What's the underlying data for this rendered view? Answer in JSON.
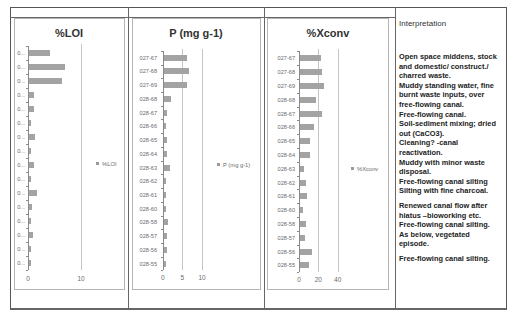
{
  "table": {
    "interpretation_header": "Interpretation",
    "interpretation_entries": [
      {
        "text": "Open space middens, stock\nand domestic/ construct./\ncharred waste.",
        "gap_before": false
      },
      {
        "text": "Muddy standing water, fine\nburnt waste inputs, over\nfree-flowing canal.",
        "gap_before": false
      },
      {
        "text": "Free-flowing canal.",
        "gap_before": false
      },
      {
        "text": "Soil-sediment mixing; dried\nout (CaCO3).",
        "gap_before": false
      },
      {
        "text": "Cleaning? -canal\nreactivation.",
        "gap_before": false
      },
      {
        "text": "Muddy with minor waste\ndisposal.",
        "gap_before": false
      },
      {
        "text": "Free-flowing canal silting",
        "gap_before": false
      },
      {
        "text": "Silting with fine charcoal.",
        "gap_before": false
      },
      {
        "text": "Renewed canal flow after\nhiatus –bioworking etc.",
        "gap_before": true
      },
      {
        "text": "Free-flowing canal silting.",
        "gap_before": false
      },
      {
        "text": "As below, vegetated\nepisode.",
        "gap_before": false
      },
      {
        "text": "Free-flowing canal silting.",
        "gap_before": true
      }
    ]
  },
  "colors": {
    "bar": "#a3a3a3",
    "border": "#555555",
    "chart_border": "#b5b5b5",
    "text": "#6a6a6a"
  },
  "chart_data": [
    {
      "id": "loi",
      "type": "bar",
      "orientation": "horizontal",
      "title": "%LOI",
      "xlabel": "",
      "ylabel": "",
      "categories": [
        "0...",
        "0...",
        "0...",
        "0...",
        "0...",
        "0...",
        "0...",
        "0...",
        "0...",
        "0...",
        "0...",
        "0...",
        "0...",
        "0...",
        "0...",
        "0..."
      ],
      "series": [
        {
          "name": "%LOI",
          "values": [
            4.0,
            6.7,
            6.3,
            0.9,
            0.9,
            0.4,
            1.1,
            0.4,
            0.9,
            0.4,
            1.5,
            0.6,
            0.4,
            0.8,
            0.3,
            0.3
          ]
        }
      ],
      "xlim": [
        0,
        10
      ],
      "xticks": [
        "0",
        "10"
      ],
      "grid": true,
      "legend_position": "right"
    },
    {
      "id": "p",
      "type": "bar",
      "orientation": "horizontal",
      "title": "P (mg g-1)",
      "xlabel": "",
      "ylabel": "",
      "categories": [
        "027-67",
        "027-68",
        "027-69",
        "028-68",
        "028-67",
        "028-66",
        "028-65",
        "028-64",
        "028-63",
        "028-62",
        "028-61",
        "028-60",
        "028-58",
        "028-57",
        "028-56",
        "028-55"
      ],
      "series": [
        {
          "name": "P (mg g-1)",
          "values": [
            5.8,
            6.3,
            5.8,
            1.8,
            0.8,
            0.6,
            0.8,
            0.8,
            1.6,
            0.5,
            0.6,
            0.5,
            0.9,
            0.7,
            0.7,
            0.5
          ]
        }
      ],
      "xlim": [
        0,
        10
      ],
      "xticks": [
        "0",
        "5",
        "10"
      ],
      "grid": true,
      "legend_position": "right"
    },
    {
      "id": "xconv",
      "type": "bar",
      "orientation": "horizontal",
      "title": "%Xconv",
      "xlabel": "",
      "ylabel": "",
      "categories": [
        "027-67",
        "027-68",
        "027-69",
        "028-68",
        "028-67",
        "028-66",
        "028-65",
        "028-64",
        "028-63",
        "028-62",
        "028-61",
        "028-60",
        "028-58",
        "028-57",
        "028-56",
        "028-55"
      ],
      "series": [
        {
          "name": "%Xconv",
          "values": [
            21.7,
            22.7,
            25.2,
            16.5,
            22.7,
            14.8,
            10.3,
            10.0,
            3.8,
            5.9,
            7.6,
            3.4,
            6.2,
            5.5,
            12.8,
            9.3
          ]
        }
      ],
      "xlim": [
        0,
        40
      ],
      "xticks": [
        "0",
        "20",
        "40"
      ],
      "grid": true,
      "legend_position": "right"
    }
  ]
}
